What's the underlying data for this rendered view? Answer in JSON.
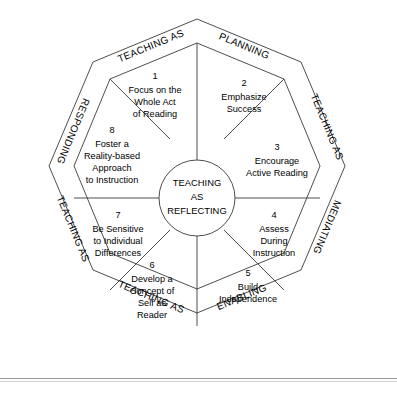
{
  "diagram": {
    "type": "octagonal-wheel",
    "center": {
      "lines": [
        "TEACHING",
        "AS",
        "REFLECTING"
      ]
    },
    "segments": [
      {
        "number": "1",
        "lines": [
          "Focus on the",
          "Whole Act",
          "of Reading"
        ]
      },
      {
        "number": "2",
        "lines": [
          "Emphasize",
          "Success"
        ]
      },
      {
        "number": "3",
        "lines": [
          "Encourage",
          "Active Reading"
        ]
      },
      {
        "number": "4",
        "lines": [
          "Assess",
          "During",
          "Instruction"
        ]
      },
      {
        "number": "5",
        "lines": [
          "Build",
          "Independence"
        ]
      },
      {
        "number": "6",
        "lines": [
          "Develop a",
          "Concept of",
          "Self as",
          "Reader"
        ]
      },
      {
        "number": "7",
        "lines": [
          "Be Sensitive",
          "to Individual",
          "Differences"
        ]
      },
      {
        "number": "8",
        "lines": [
          "Foster a",
          "Reality-based",
          "Approach",
          "to Instruction"
        ]
      }
    ],
    "bands": [
      {
        "id": "band-top-left",
        "label": "TEACHING AS"
      },
      {
        "id": "band-top-right",
        "label": "PLANNING"
      },
      {
        "id": "band-right-upper",
        "label": "TEACHING AS"
      },
      {
        "id": "band-right-lower",
        "label": "MEDIATING"
      },
      {
        "id": "band-bottom-right",
        "label": "ENABLING"
      },
      {
        "id": "band-bottom-left",
        "label": "TEACHING AS"
      },
      {
        "id": "band-left-lower",
        "label": "TEACHING AS"
      },
      {
        "id": "band-left-upper",
        "label": "RESPONDING"
      }
    ],
    "colors": {
      "stroke": "#3a3a3a",
      "text": "#000000",
      "background": "#ffffff",
      "rule": "#9a9a9a"
    }
  }
}
